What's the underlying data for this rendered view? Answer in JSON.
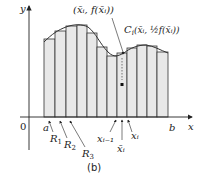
{
  "figure": {
    "caption": "(b)",
    "axes": {
      "x_label": "x",
      "y_label": "y",
      "origin_label": "0"
    },
    "interval": {
      "a": "a",
      "b": "b"
    },
    "strip_labels": [
      "R",
      "R",
      "R"
    ],
    "strip_subscripts": [
      "1",
      "2",
      "3"
    ],
    "point_labels": {
      "top_point": "(x̄ᵢ, f(x̄ᵢ))",
      "centroid_prefix": "C",
      "centroid_sub": "i",
      "centroid_body": "(x̄ᵢ, ½f(x̄ᵢ))"
    },
    "x_ticks": {
      "left": "xᵢ₋₁",
      "mid": "x̄ᵢ",
      "right": "xᵢ"
    },
    "colors": {
      "fill": "#e6e6e6",
      "stroke": "#333333"
    }
  }
}
